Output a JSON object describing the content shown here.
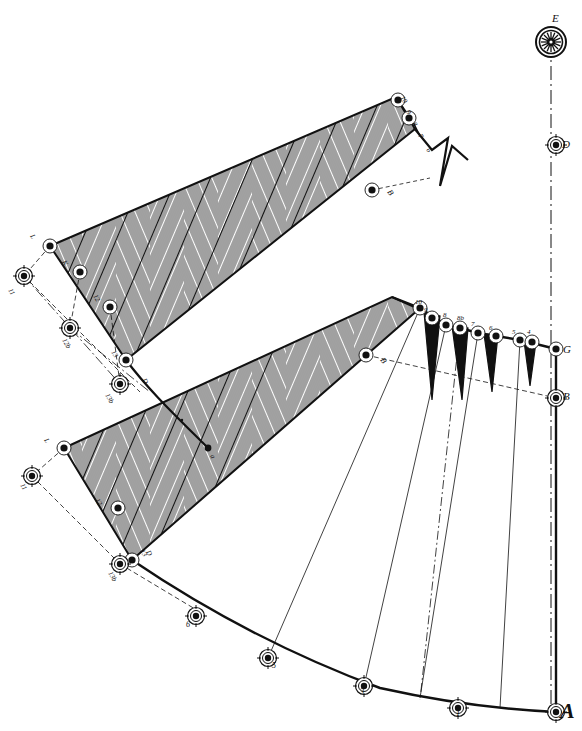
{
  "figure": {
    "background_color": "#ffffff",
    "ink_color": "#111111",
    "hatch_color": "#333333",
    "width": 582,
    "height": 731
  },
  "labels": {
    "axis": [
      {
        "name": "E",
        "text": "E",
        "x": 552,
        "y": 22,
        "size": "mid"
      },
      {
        "name": "D",
        "text": "D",
        "x": 562,
        "y": 148,
        "size": "mid"
      },
      {
        "name": "G",
        "text": "G",
        "x": 563,
        "y": 353,
        "size": "mid"
      },
      {
        "name": "B",
        "text": "B",
        "x": 563,
        "y": 400,
        "size": "mid"
      },
      {
        "name": "A",
        "text": "A",
        "x": 560,
        "y": 718,
        "size": "big"
      }
    ],
    "b_marks": [
      {
        "name": "B-upper",
        "text": "B",
        "x": 387,
        "y": 192,
        "size": "small"
      },
      {
        "name": "B-lower",
        "text": "B",
        "x": 380,
        "y": 360,
        "size": "small"
      }
    ],
    "upper_band_teeth": [
      {
        "text": "10",
        "x": 400,
        "y": 98
      },
      {
        "text": "9",
        "x": 406,
        "y": 112
      },
      {
        "text": "8",
        "x": 412,
        "y": 124
      },
      {
        "text": "7",
        "x": 418,
        "y": 136
      },
      {
        "text": "6",
        "x": 426,
        "y": 150
      }
    ],
    "lower_band_teeth": [
      {
        "text": "10",
        "x": 415,
        "y": 304
      },
      {
        "text": "9",
        "x": 424,
        "y": 312
      },
      {
        "text": "8",
        "x": 443,
        "y": 317
      },
      {
        "text": "8b",
        "x": 457,
        "y": 320
      },
      {
        "text": "7",
        "x": 471,
        "y": 326
      },
      {
        "text": "6",
        "x": 489,
        "y": 330
      },
      {
        "text": "5",
        "x": 512,
        "y": 334
      },
      {
        "text": "4",
        "x": 527,
        "y": 334
      }
    ],
    "upper_left_series": [
      {
        "text": "L",
        "x": 30,
        "y": 236
      },
      {
        "text": "K",
        "x": 62,
        "y": 262
      },
      {
        "text": "12",
        "x": 93,
        "y": 296
      },
      {
        "text": "13",
        "x": 111,
        "y": 352
      },
      {
        "text": "11",
        "x": 8,
        "y": 290
      },
      {
        "text": "12b",
        "x": 62,
        "y": 340
      },
      {
        "text": "13b",
        "x": 105,
        "y": 395
      },
      {
        "text": "D",
        "x": 142,
        "y": 380
      }
    ],
    "lower_left_series": [
      {
        "text": "L",
        "x": 44,
        "y": 440
      },
      {
        "text": "11",
        "x": 20,
        "y": 485
      },
      {
        "text": "12",
        "x": 95,
        "y": 500
      },
      {
        "text": "13",
        "x": 140,
        "y": 551
      },
      {
        "text": "13b",
        "x": 108,
        "y": 573
      },
      {
        "text": "D",
        "x": 146,
        "y": 552
      }
    ],
    "arc_points": [
      {
        "text": "6",
        "x": 186,
        "y": 627
      },
      {
        "text": "5",
        "x": 272,
        "y": 668
      },
      {
        "text": "3",
        "x": 360,
        "y": 694
      },
      {
        "text": "1",
        "x": 456,
        "y": 716
      }
    ],
    "centre_mark": {
      "text": "a",
      "x": 210,
      "y": 456
    }
  },
  "markers": {
    "description": "circled node markers along construction lines",
    "plain_nodes": [
      {
        "cx": 398,
        "cy": 100
      },
      {
        "cx": 409,
        "cy": 118
      },
      {
        "cx": 50,
        "cy": 246
      },
      {
        "cx": 80,
        "cy": 272
      },
      {
        "cx": 110,
        "cy": 307
      },
      {
        "cx": 126,
        "cy": 360
      },
      {
        "cx": 372,
        "cy": 190
      },
      {
        "cx": 420,
        "cy": 308
      },
      {
        "cx": 432,
        "cy": 318
      },
      {
        "cx": 446,
        "cy": 325
      },
      {
        "cx": 460,
        "cy": 328
      },
      {
        "cx": 478,
        "cy": 333
      },
      {
        "cx": 496,
        "cy": 336
      },
      {
        "cx": 520,
        "cy": 340
      },
      {
        "cx": 532,
        "cy": 342
      },
      {
        "cx": 556,
        "cy": 349
      },
      {
        "cx": 64,
        "cy": 448
      },
      {
        "cx": 118,
        "cy": 508
      },
      {
        "cx": 132,
        "cy": 560
      },
      {
        "cx": 366,
        "cy": 355
      }
    ],
    "target_nodes": [
      {
        "cx": 24,
        "cy": 276
      },
      {
        "cx": 70,
        "cy": 328
      },
      {
        "cx": 120,
        "cy": 384
      },
      {
        "cx": 32,
        "cy": 476
      },
      {
        "cx": 120,
        "cy": 564
      },
      {
        "cx": 556,
        "cy": 145
      },
      {
        "cx": 556,
        "cy": 398
      },
      {
        "cx": 556,
        "cy": 712
      },
      {
        "cx": 196,
        "cy": 616
      },
      {
        "cx": 268,
        "cy": 658
      },
      {
        "cx": 364,
        "cy": 686
      },
      {
        "cx": 458,
        "cy": 708
      }
    ],
    "rosette_node": {
      "cx": 551,
      "cy": 42,
      "r": 16
    }
  },
  "geometry": {
    "axis_line": {
      "x": 551,
      "y1": 42,
      "y2": 712,
      "style": "dash-dot"
    },
    "upper_band": {
      "comment": "upper chevron-hatched parallelogram band",
      "outline": "M 50,246 L 396,97 L 414,128 L 126,360 Z"
    },
    "lower_band": {
      "comment": "lower chevron-hatched parallelogram band",
      "outline": "M 64,448 L 392,297 L 418,308 L 132,560 Z"
    },
    "fan_sector": {
      "comment": "large lower-right fan / sector bounded by bottom arc",
      "apex": {
        "x": 556,
        "y": 349
      }
    },
    "bottom_arc": {
      "from": {
        "x": 132,
        "y": 560
      },
      "to": {
        "x": 556,
        "y": 712
      }
    }
  },
  "chart_data": {
    "type": "diagram",
    "elements": [
      "vertical dash-dot centre axis with nodes E, D, G, B, A",
      "two chevron (herringbone) hatched parallelogram bands upper-left",
      "radial fan sector lower-right with numbered sawtooth notches",
      "bottom circular arc with numbered station points 1,3,5,6"
    ]
  }
}
